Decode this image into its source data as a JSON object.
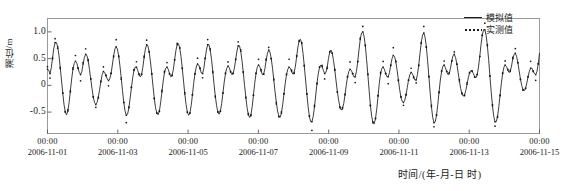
{
  "chart_data": {
    "type": "line",
    "title": "",
    "xlabel": "时间/(年-月-日 时)",
    "ylabel": "潮位/m",
    "grid": false,
    "legend_position": "top-right",
    "ylim": [
      -0.9,
      1.25
    ],
    "yticks": [
      "1.0",
      "0.5",
      "0",
      "-0.5"
    ],
    "ytick_values": [
      1.0,
      0.5,
      0,
      -0.5
    ],
    "xlim_days": [
      0,
      14
    ],
    "xticks": [
      {
        "time": "00:00",
        "date": "2006-11-01",
        "day": 0
      },
      {
        "time": "00:00",
        "date": "2006-11-03",
        "day": 2
      },
      {
        "time": "00:00",
        "date": "2006-11-05",
        "day": 4
      },
      {
        "time": "00:00",
        "date": "2006-11-07",
        "day": 6
      },
      {
        "time": "00:00",
        "date": "2006-11-09",
        "day": 8
      },
      {
        "time": "00:00",
        "date": "2006-11-11",
        "day": 10
      },
      {
        "time": "00:00",
        "date": "2006-11-13",
        "day": 12
      },
      {
        "time": "00:00",
        "date": "2006-11-15",
        "day": 14
      }
    ],
    "series": [
      {
        "name": "模拟值",
        "style": "solid-line-with-markers",
        "color": "#1a1a1a",
        "x_step_hours": 1,
        "values": [
          0.3,
          0.28,
          0.22,
          0.33,
          0.52,
          0.7,
          0.8,
          0.8,
          0.72,
          0.56,
          0.34,
          0.1,
          -0.14,
          -0.36,
          -0.5,
          -0.55,
          -0.48,
          -0.32,
          -0.1,
          0.12,
          0.3,
          0.41,
          0.45,
          0.42,
          0.33,
          0.24,
          0.2,
          0.26,
          0.4,
          0.52,
          0.58,
          0.56,
          0.46,
          0.3,
          0.12,
          -0.06,
          -0.22,
          -0.32,
          -0.36,
          -0.32,
          -0.22,
          -0.08,
          0.08,
          0.2,
          0.26,
          0.24,
          0.18,
          0.12,
          0.09,
          0.12,
          0.22,
          0.38,
          0.55,
          0.68,
          0.72,
          0.68,
          0.55,
          0.36,
          0.14,
          -0.1,
          -0.32,
          -0.48,
          -0.56,
          -0.54,
          -0.42,
          -0.24,
          -0.04,
          0.14,
          0.28,
          0.34,
          0.34,
          0.28,
          0.2,
          0.16,
          0.2,
          0.34,
          0.52,
          0.68,
          0.76,
          0.74,
          0.62,
          0.44,
          0.22,
          -0.02,
          -0.24,
          -0.42,
          -0.52,
          -0.55,
          -0.48,
          -0.32,
          -0.12,
          0.08,
          0.24,
          0.32,
          0.34,
          0.3,
          0.22,
          0.16,
          0.18,
          0.3,
          0.48,
          0.65,
          0.76,
          0.78,
          0.7,
          0.54,
          0.32,
          0.08,
          -0.16,
          -0.36,
          -0.5,
          -0.56,
          -0.52,
          -0.38,
          -0.18,
          0.04,
          0.22,
          0.34,
          0.4,
          0.38,
          0.31,
          0.23,
          0.22,
          0.32,
          0.5,
          0.66,
          0.76,
          0.76,
          0.66,
          0.49,
          0.26,
          0.02,
          -0.2,
          -0.38,
          -0.5,
          -0.54,
          -0.48,
          -0.34,
          -0.14,
          0.06,
          0.22,
          0.32,
          0.36,
          0.33,
          0.26,
          0.2,
          0.22,
          0.32,
          0.48,
          0.64,
          0.74,
          0.74,
          0.64,
          0.46,
          0.24,
          0.0,
          -0.22,
          -0.42,
          -0.55,
          -0.6,
          -0.55,
          -0.4,
          -0.18,
          0.04,
          0.22,
          0.34,
          0.38,
          0.35,
          0.27,
          0.2,
          0.21,
          0.31,
          0.47,
          0.6,
          0.66,
          0.62,
          0.5,
          0.32,
          0.1,
          -0.12,
          -0.32,
          -0.48,
          -0.58,
          -0.6,
          -0.52,
          -0.36,
          -0.16,
          0.04,
          0.2,
          0.3,
          0.34,
          0.32,
          0.26,
          0.21,
          0.24,
          0.36,
          0.54,
          0.72,
          0.84,
          0.86,
          0.78,
          0.6,
          0.36,
          0.1,
          -0.16,
          -0.4,
          -0.58,
          -0.68,
          -0.68,
          -0.58,
          -0.4,
          -0.18,
          0.04,
          0.22,
          0.34,
          0.38,
          0.35,
          0.28,
          0.22,
          0.24,
          0.34,
          0.5,
          0.62,
          0.66,
          0.6,
          0.46,
          0.28,
          0.08,
          -0.12,
          -0.28,
          -0.4,
          -0.46,
          -0.44,
          -0.34,
          -0.18,
          0.0,
          0.16,
          0.26,
          0.3,
          0.28,
          0.22,
          0.16,
          0.16,
          0.26,
          0.44,
          0.66,
          0.86,
          0.98,
          1.0,
          0.92,
          0.74,
          0.48,
          0.2,
          -0.1,
          -0.38,
          -0.58,
          -0.7,
          -0.72,
          -0.62,
          -0.44,
          -0.2,
          0.04,
          0.22,
          0.32,
          0.34,
          0.3,
          0.22,
          0.16,
          0.16,
          0.24,
          0.38,
          0.5,
          0.56,
          0.54,
          0.44,
          0.28,
          0.1,
          -0.08,
          -0.22,
          -0.3,
          -0.32,
          -0.28,
          -0.18,
          -0.04,
          0.1,
          0.2,
          0.24,
          0.22,
          0.16,
          0.1,
          0.1,
          0.2,
          0.38,
          0.6,
          0.8,
          0.94,
          0.98,
          0.9,
          0.72,
          0.46,
          0.16,
          -0.14,
          -0.4,
          -0.6,
          -0.7,
          -0.68,
          -0.56,
          -0.36,
          -0.12,
          0.1,
          0.26,
          0.36,
          0.38,
          0.33,
          0.26,
          0.2,
          0.22,
          0.32,
          0.46,
          0.56,
          0.58,
          0.52,
          0.4,
          0.24,
          0.08,
          -0.06,
          -0.16,
          -0.2,
          -0.18,
          -0.1,
          0.02,
          0.14,
          0.24,
          0.28,
          0.27,
          0.22,
          0.16,
          0.14,
          0.2,
          0.34,
          0.54,
          0.76,
          0.94,
          1.04,
          1.04,
          0.94,
          0.74,
          0.48,
          0.18,
          -0.12,
          -0.38,
          -0.58,
          -0.68,
          -0.68,
          -0.58,
          -0.4,
          -0.18,
          0.04,
          0.22,
          0.34,
          0.38,
          0.35,
          0.29,
          0.24,
          0.26,
          0.36,
          0.5,
          0.58,
          0.6,
          0.54,
          0.42,
          0.27,
          0.12,
          0.0,
          -0.08,
          -0.1,
          -0.06,
          0.04,
          0.16,
          0.26,
          0.32,
          0.32,
          0.27,
          0.22,
          0.2,
          0.26,
          0.4,
          0.6
        ]
      },
      {
        "name": "实测值",
        "style": "dotted-scatter",
        "color": "#1a1a1a",
        "note": "measured points scatter closely around the simulated curve, with slightly higher peaks and lower troughs"
      }
    ]
  },
  "legend": {
    "items": [
      {
        "label": "模拟值",
        "key": "solid"
      },
      {
        "label": "实测值",
        "key": "dotted"
      }
    ]
  }
}
